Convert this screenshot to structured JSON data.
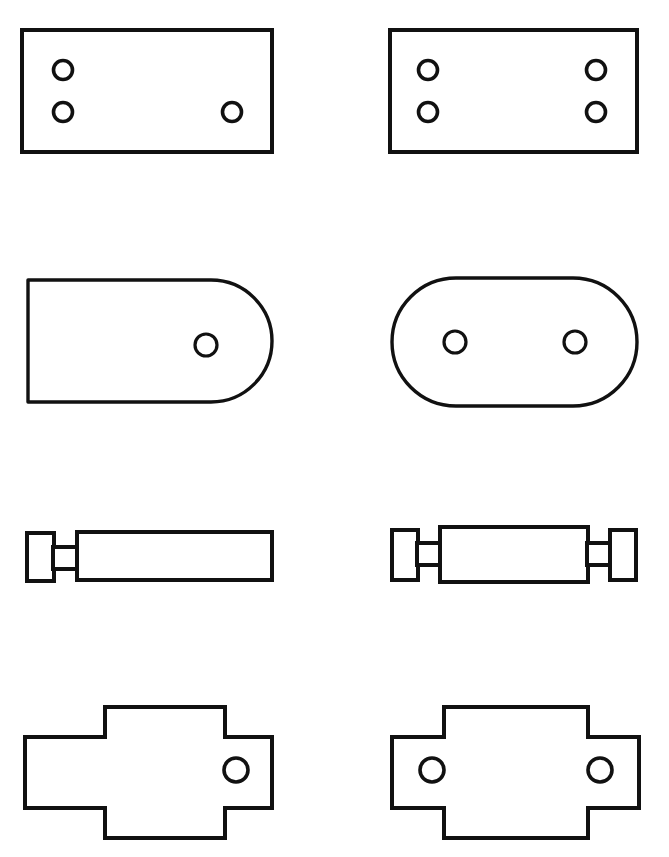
{
  "sheet": {
    "title": "Mechanical Parts Outline Drawing",
    "width": 669,
    "height": 857,
    "background_color": "#ffffff",
    "line_color": "#111111",
    "fill_color": "#ffffff",
    "description": "Four rows of paired black-outline mechanical part silhouettes, asymmetric variant at left and symmetric variant at right.",
    "columns": [
      "left",
      "right"
    ],
    "row_count": 4,
    "column_count": 2
  },
  "rows": [
    {
      "row_index": 1,
      "row_name": "drilled-plate-row",
      "left": {
        "part_name": "drilled-rectangular-plate-asymmetric",
        "shape": "rectangle",
        "hole_count": 3,
        "symmetric": false,
        "outline": {
          "x": 22,
          "y": 30,
          "width": 250,
          "height": 122
        },
        "holes": [
          {
            "cx": 63,
            "cy": 70,
            "r": 9.5
          },
          {
            "cx": 63,
            "cy": 112,
            "r": 9.5
          },
          {
            "cx": 232,
            "cy": 112,
            "r": 9.5
          }
        ]
      },
      "right": {
        "part_name": "drilled-rectangular-plate-symmetric",
        "shape": "rectangle",
        "hole_count": 4,
        "symmetric": true,
        "outline": {
          "x": 390,
          "y": 30,
          "width": 247,
          "height": 122
        },
        "holes": [
          {
            "cx": 428,
            "cy": 70,
            "r": 9.5
          },
          {
            "cx": 428,
            "cy": 112,
            "r": 9.5
          },
          {
            "cx": 596,
            "cy": 70,
            "r": 9.5
          },
          {
            "cx": 596,
            "cy": 112,
            "r": 9.5
          }
        ]
      }
    },
    {
      "row_index": 2,
      "row_name": "rounded-link-row",
      "left": {
        "part_name": "d-shaped-link-asymmetric",
        "shape": "d-shape",
        "hole_count": 1,
        "symmetric": false,
        "outline": {
          "x": 26,
          "y": 280,
          "width": 246,
          "height": 123,
          "corner_radius_right": 61
        },
        "holes": [
          {
            "cx": 206,
            "cy": 345,
            "r": 11
          }
        ]
      },
      "right": {
        "part_name": "obround-link-symmetric",
        "shape": "stadium",
        "hole_count": 2,
        "symmetric": true,
        "outline": {
          "x": 391,
          "y": 278,
          "width": 246,
          "height": 128,
          "corner_radius": 64
        },
        "holes": [
          {
            "cx": 455,
            "cy": 342,
            "r": 11
          },
          {
            "cx": 575,
            "cy": 342,
            "r": 11
          }
        ]
      }
    },
    {
      "row_index": 3,
      "row_name": "shaft-collar-row",
      "left": {
        "part_name": "shaft-with-single-collar",
        "shape": "stepped-shaft",
        "symmetric": false,
        "collar_count": 1,
        "body": {
          "x": 77,
          "y": 532,
          "width": 195,
          "height": 48
        },
        "necks": [
          {
            "x": 53,
            "y": 547,
            "width": 25,
            "height": 22
          }
        ],
        "collars": [
          {
            "x": 27,
            "y": 533,
            "width": 27,
            "height": 48
          }
        ]
      },
      "right": {
        "part_name": "shaft-with-double-collar",
        "shape": "stepped-shaft",
        "symmetric": true,
        "collar_count": 2,
        "body": {
          "x": 440,
          "y": 527,
          "width": 148,
          "height": 55
        },
        "necks": [
          {
            "x": 417,
            "y": 543,
            "width": 24,
            "height": 22
          },
          {
            "x": 587,
            "y": 543,
            "width": 24,
            "height": 22
          }
        ],
        "collars": [
          {
            "x": 392,
            "y": 530,
            "width": 26,
            "height": 50
          },
          {
            "x": 610,
            "y": 530,
            "width": 26,
            "height": 50
          }
        ]
      }
    },
    {
      "row_index": 4,
      "row_name": "cruciform-flange-row",
      "left": {
        "part_name": "cruciform-flange-asymmetric",
        "shape": "cruciform",
        "hole_count": 1,
        "symmetric": false,
        "bounds": {
          "x": 25,
          "y": 707,
          "width": 247,
          "height": 131
        },
        "center_tab": {
          "x_start": 105,
          "x_end": 225,
          "top": 707,
          "bottom": 838
        },
        "web": {
          "y_top": 737,
          "y_bottom": 808
        },
        "holes": [
          {
            "cx": 236,
            "cy": 770,
            "r": 12
          }
        ]
      },
      "right": {
        "part_name": "cruciform-flange-symmetric",
        "shape": "cruciform",
        "hole_count": 2,
        "symmetric": true,
        "bounds": {
          "x": 392,
          "y": 707,
          "width": 247,
          "height": 131
        },
        "center_tab": {
          "x_start": 444,
          "x_end": 588,
          "top": 707,
          "bottom": 838
        },
        "web": {
          "y_top": 737,
          "y_bottom": 808
        },
        "holes": [
          {
            "cx": 432,
            "cy": 770,
            "r": 12
          },
          {
            "cx": 600,
            "cy": 770,
            "r": 12
          }
        ]
      }
    }
  ]
}
